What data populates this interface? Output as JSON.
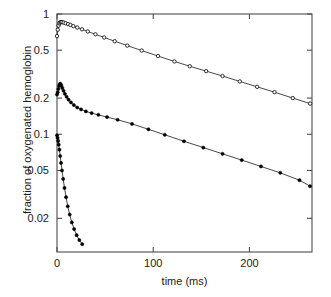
{
  "chart_data": {
    "type": "line",
    "title": "",
    "xlabel": "time (ms)",
    "ylabel": "fraction of oxygenated hemoglobin",
    "yscale": "log",
    "xscale": "linear",
    "xlim": [
      0,
      265
    ],
    "ylim": [
      0.0105,
      1.0
    ],
    "grid": false,
    "legend": "none",
    "xticks": [
      0,
      100,
      200
    ],
    "xticklabels": [
      "0",
      "100",
      "200"
    ],
    "yticks": [
      1,
      0.5,
      0.2,
      0.1,
      0.05,
      0.02
    ],
    "yticklabels": [
      "1",
      "0.5",
      "0.2",
      "0.1",
      "0.05",
      "0.02"
    ],
    "series": [
      {
        "name": "slow decay (open circles)",
        "marker": "open-circle",
        "x": [
          0.0,
          0.8,
          1.6,
          2.4,
          3.2,
          4.2,
          5.5,
          7.0,
          9.0,
          11.5,
          14.0,
          17.0,
          21.0,
          26.0,
          32.0,
          40.0,
          49.0,
          60.0,
          73.0,
          88.0,
          105.0,
          122.0,
          138.0,
          155.0,
          172.0,
          190.0,
          208.0,
          226.0,
          245.0,
          263.0
        ],
        "y": [
          0.655,
          0.74,
          0.8,
          0.835,
          0.852,
          0.858,
          0.855,
          0.848,
          0.838,
          0.824,
          0.81,
          0.793,
          0.772,
          0.746,
          0.716,
          0.678,
          0.638,
          0.594,
          0.546,
          0.497,
          0.447,
          0.403,
          0.368,
          0.335,
          0.305,
          0.275,
          0.248,
          0.224,
          0.2,
          0.18
        ]
      },
      {
        "name": "intermediate decay (filled circles)",
        "marker": "filled-circle",
        "x": [
          0.0,
          0.7,
          1.4,
          2.1,
          2.8,
          3.6,
          4.5,
          5.5,
          6.8,
          8.2,
          10.0,
          12.0,
          14.5,
          17.5,
          21.0,
          25.0,
          30.0,
          36.0,
          43.0,
          52.0,
          63.0,
          78.0,
          95.0,
          112.0,
          132.0,
          152.0,
          172.0,
          192.0,
          212.0,
          232.0,
          252.0,
          263.0
        ],
        "y": [
          0.214,
          0.223,
          0.238,
          0.252,
          0.261,
          0.263,
          0.255,
          0.243,
          0.23,
          0.217,
          0.205,
          0.194,
          0.184,
          0.175,
          0.167,
          0.161,
          0.155,
          0.15,
          0.145,
          0.139,
          0.132,
          0.122,
          0.11,
          0.099,
          0.0875,
          0.0775,
          0.0688,
          0.061,
          0.054,
          0.0478,
          0.0415,
          0.037
        ]
      },
      {
        "name": "fast decay (filled circles)",
        "marker": "filled-circle",
        "x": [
          0.0,
          0.6,
          1.2,
          1.8,
          2.5,
          3.3,
          4.2,
          5.2,
          6.4,
          7.8,
          9.4,
          11.2,
          13.2,
          15.4,
          17.8,
          20.4,
          23.2,
          26.2
        ],
        "y": [
          0.098,
          0.0935,
          0.088,
          0.082,
          0.0745,
          0.066,
          0.0578,
          0.05,
          0.0425,
          0.0358,
          0.03,
          0.0252,
          0.0215,
          0.0185,
          0.0163,
          0.0145,
          0.0132,
          0.0122
        ]
      }
    ]
  },
  "axes": {
    "plot_frame": {
      "left": 57,
      "top": 14,
      "right": 312,
      "bottom": 252
    },
    "line_color": "#333333",
    "marker_color": "#000000",
    "frame_color": "#4d4d4d"
  }
}
